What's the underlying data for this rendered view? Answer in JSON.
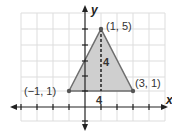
{
  "diagram": {
    "type": "coordinate-plane-triangle",
    "axes": {
      "x_label": "x",
      "y_label": "y"
    },
    "grid": {
      "x_range": [
        -4,
        5
      ],
      "y_range": [
        -2,
        5
      ],
      "spacing_px": 16
    },
    "vertices": [
      {
        "label": "(−1, 1)",
        "x": -1,
        "y": 1
      },
      {
        "label": "(1, 5)",
        "x": 1,
        "y": 5
      },
      {
        "label": "(3, 1)",
        "x": 3,
        "y": 1
      }
    ],
    "dimensions": {
      "base_label": "4",
      "height_label": "4"
    },
    "colors": {
      "fill": "#cfcfcf",
      "edge": "#6e6e6e",
      "grid": "#dddddd",
      "axis": "#222222"
    }
  }
}
